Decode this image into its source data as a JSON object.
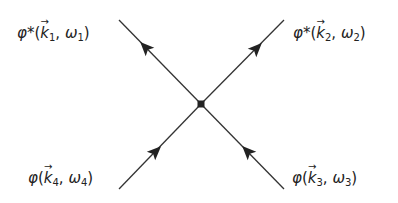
{
  "diagram": {
    "type": "feynman-four-point-vertex",
    "colors": {
      "line": "#333333",
      "vertex": "#111111",
      "text": "#222222",
      "background": "#ffffff"
    },
    "vertex": {
      "x": 201,
      "y": 104
    },
    "legs": [
      {
        "id": "leg1",
        "end": {
          "x": 119,
          "y": 20
        },
        "direction": "outgoing",
        "label": {
          "field": "φ*",
          "k": "k",
          "k_sub": "1",
          "omega": "ω",
          "omega_sub": "1"
        }
      },
      {
        "id": "leg2",
        "end": {
          "x": 284,
          "y": 20
        },
        "direction": "outgoing",
        "label": {
          "field": "φ*",
          "k": "k",
          "k_sub": "2",
          "omega": "ω",
          "omega_sub": "2"
        }
      },
      {
        "id": "leg3",
        "end": {
          "x": 284,
          "y": 189
        },
        "direction": "incoming",
        "label": {
          "field": "φ",
          "k": "k",
          "k_sub": "3",
          "omega": "ω",
          "omega_sub": "3"
        }
      },
      {
        "id": "leg4",
        "end": {
          "x": 119,
          "y": 189
        },
        "direction": "incoming",
        "label": {
          "field": "φ",
          "k": "k",
          "k_sub": "4",
          "omega": "ω",
          "omega_sub": "4"
        }
      }
    ],
    "punct": {
      "open": "(",
      "comma": ", ",
      "close": ")"
    }
  }
}
